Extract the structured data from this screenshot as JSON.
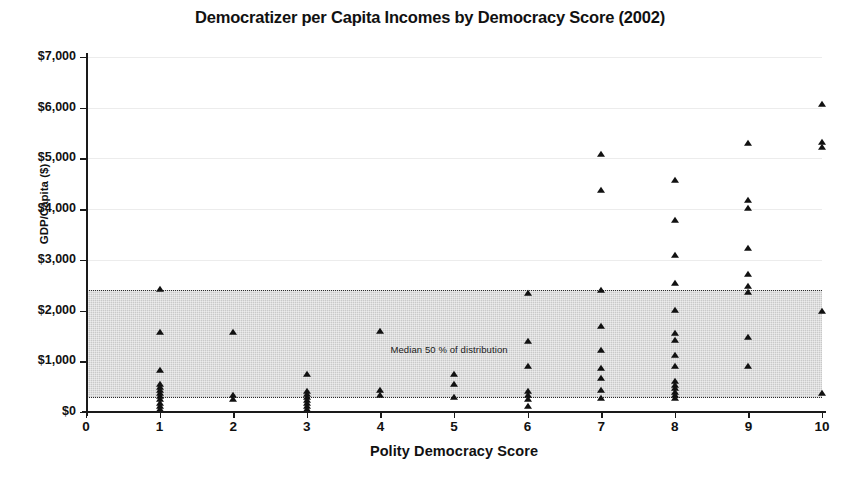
{
  "chart_data": {
    "type": "scatter",
    "title": "Democratizer per Capita Incomes by Democracy Score (2002)",
    "xlabel": "Polity Democracy Score",
    "ylabel": "GDP/Capita ($)",
    "xlim": [
      0,
      10
    ],
    "ylim": [
      0,
      7000
    ],
    "xticks": [
      0,
      1,
      2,
      3,
      4,
      5,
      6,
      7,
      8,
      9,
      10
    ],
    "xtick_labels": [
      "0",
      "1",
      "2",
      "3",
      "4",
      "5",
      "6",
      "7",
      "8",
      "9",
      "10"
    ],
    "yticks": [
      0,
      1000,
      2000,
      3000,
      4000,
      5000,
      6000,
      7000
    ],
    "ytick_labels": [
      "$0",
      "$1,000",
      "$2,000",
      "$3,000",
      "$4,000",
      "$5,000",
      "$6,000",
      "$7,000"
    ],
    "grid": true,
    "legend": "none",
    "marker": "triangle",
    "marker_color": "#111111",
    "band": {
      "label": "Median 50 % of distribution",
      "y_low": 280,
      "y_high": 2410,
      "fill_color": "#c9c9c9",
      "edge_style": "dotted",
      "x_start": 0,
      "x_end": 10
    },
    "points": [
      {
        "x": 1,
        "y": 2430
      },
      {
        "x": 1,
        "y": 1580
      },
      {
        "x": 1,
        "y": 830
      },
      {
        "x": 1,
        "y": 560
      },
      {
        "x": 1,
        "y": 490
      },
      {
        "x": 1,
        "y": 430
      },
      {
        "x": 1,
        "y": 380
      },
      {
        "x": 1,
        "y": 310
      },
      {
        "x": 1,
        "y": 250
      },
      {
        "x": 1,
        "y": 180
      },
      {
        "x": 1,
        "y": 120
      },
      {
        "x": 1,
        "y": 60
      },
      {
        "x": 2,
        "y": 1580
      },
      {
        "x": 2,
        "y": 340
      },
      {
        "x": 2,
        "y": 250
      },
      {
        "x": 3,
        "y": 750
      },
      {
        "x": 3,
        "y": 420
      },
      {
        "x": 3,
        "y": 350
      },
      {
        "x": 3,
        "y": 290
      },
      {
        "x": 3,
        "y": 230
      },
      {
        "x": 3,
        "y": 170
      },
      {
        "x": 3,
        "y": 110
      },
      {
        "x": 3,
        "y": 50
      },
      {
        "x": 4,
        "y": 1600
      },
      {
        "x": 4,
        "y": 430
      },
      {
        "x": 4,
        "y": 330
      },
      {
        "x": 5,
        "y": 750
      },
      {
        "x": 5,
        "y": 560
      },
      {
        "x": 5,
        "y": 300
      },
      {
        "x": 6,
        "y": 2350
      },
      {
        "x": 6,
        "y": 1400
      },
      {
        "x": 6,
        "y": 900
      },
      {
        "x": 6,
        "y": 420
      },
      {
        "x": 6,
        "y": 330
      },
      {
        "x": 6,
        "y": 250
      },
      {
        "x": 6,
        "y": 110
      },
      {
        "x": 7,
        "y": 5080
      },
      {
        "x": 7,
        "y": 4370
      },
      {
        "x": 7,
        "y": 2410
      },
      {
        "x": 7,
        "y": 1700
      },
      {
        "x": 7,
        "y": 1230
      },
      {
        "x": 7,
        "y": 860
      },
      {
        "x": 7,
        "y": 680
      },
      {
        "x": 7,
        "y": 430
      },
      {
        "x": 7,
        "y": 280
      },
      {
        "x": 8,
        "y": 4580
      },
      {
        "x": 8,
        "y": 3780
      },
      {
        "x": 8,
        "y": 3100
      },
      {
        "x": 8,
        "y": 2540
      },
      {
        "x": 8,
        "y": 2020
      },
      {
        "x": 8,
        "y": 1550
      },
      {
        "x": 8,
        "y": 1420
      },
      {
        "x": 8,
        "y": 1130
      },
      {
        "x": 8,
        "y": 900
      },
      {
        "x": 8,
        "y": 620
      },
      {
        "x": 8,
        "y": 540
      },
      {
        "x": 8,
        "y": 470
      },
      {
        "x": 8,
        "y": 400
      },
      {
        "x": 8,
        "y": 330
      },
      {
        "x": 8,
        "y": 280
      },
      {
        "x": 9,
        "y": 5300
      },
      {
        "x": 9,
        "y": 4180
      },
      {
        "x": 9,
        "y": 4030
      },
      {
        "x": 9,
        "y": 3230
      },
      {
        "x": 9,
        "y": 2730
      },
      {
        "x": 9,
        "y": 2480
      },
      {
        "x": 9,
        "y": 2370
      },
      {
        "x": 9,
        "y": 1470
      },
      {
        "x": 9,
        "y": 900
      },
      {
        "x": 10,
        "y": 6080
      },
      {
        "x": 10,
        "y": 5330
      },
      {
        "x": 10,
        "y": 5230
      },
      {
        "x": 10,
        "y": 2000
      },
      {
        "x": 10,
        "y": 380
      }
    ]
  }
}
